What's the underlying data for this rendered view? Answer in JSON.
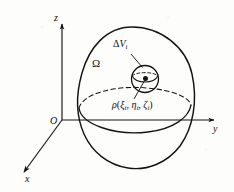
{
  "figure": {
    "background_color": "#fdfdfc",
    "stroke_color": "#141414",
    "axes": {
      "z_label": "z",
      "y_label": "y",
      "x_label": "x",
      "origin_label": "O"
    },
    "labels": {
      "region": "Ω",
      "element_symbol": "Δ",
      "element_letter": "V",
      "element_subscript": "i",
      "density_symbol": "ρ",
      "open_paren": "(",
      "xi": "ξ",
      "xi_sub": "i",
      "comma1": ",",
      "eta": "η",
      "eta_sub": "i",
      "comma2": ",",
      "zeta": "ζ",
      "zeta_sub": "i",
      "close_paren": ")"
    },
    "geometry": {
      "region_name": "egg-shaped-solid",
      "equator_style": "dashed",
      "sample_point_style": "filled-dot",
      "small_sphere_name": "volume-element-sphere"
    }
  }
}
